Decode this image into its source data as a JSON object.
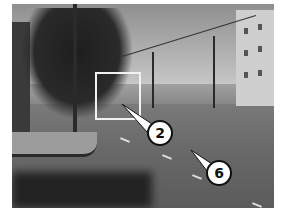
{
  "image": {
    "description": "Black-and-white street photo of a city intersection with utility poles, trees, buildings and a highlighted region",
    "highlight_box": {
      "label": "highlighted-area"
    },
    "callouts": [
      {
        "number": "2",
        "target": "highlighted-area"
      },
      {
        "number": "6",
        "target": "street-surface"
      }
    ]
  }
}
